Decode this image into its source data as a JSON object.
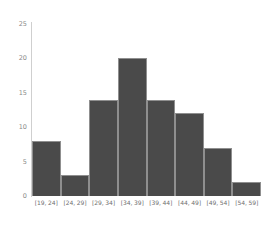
{
  "chart_data": {
    "type": "bar",
    "title": "",
    "subtitle": "",
    "xlabel": "",
    "ylabel": "",
    "categories": [
      "[19, 24]",
      "[24, 29]",
      "[29, 34]",
      "[34, 39]",
      "[39, 44]",
      "[44, 49]",
      "[49, 54]",
      "[54, 59]"
    ],
    "values": [
      8,
      3,
      14,
      20,
      14,
      12,
      7,
      2
    ],
    "ylim": [
      0,
      25
    ],
    "yticks": [
      0,
      5,
      10,
      15,
      20,
      25
    ],
    "ytick_labels": [
      "0",
      "5",
      "10",
      "15",
      "20",
      "25"
    ],
    "grid": false,
    "legend": "none",
    "bar_color": "#4a4a4a",
    "bar_edge_color": "#8f8f8f",
    "axis_color": "#cfcfcf",
    "tick_text_color": "#8a8a8a",
    "background": "#ffffff"
  }
}
